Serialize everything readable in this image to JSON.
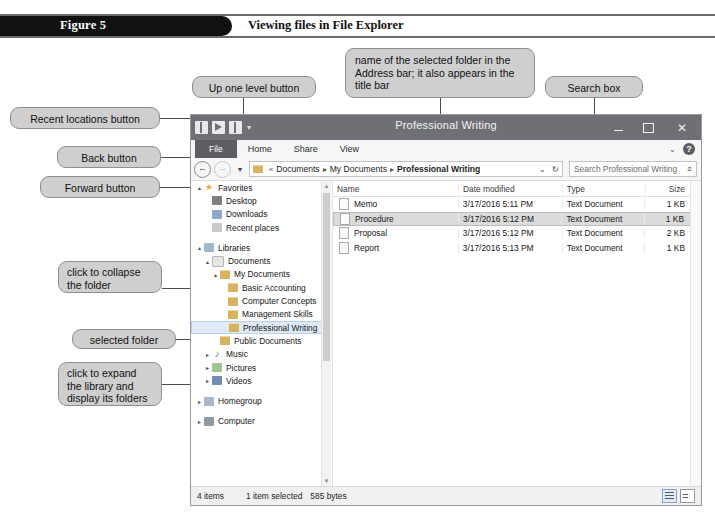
{
  "figure": {
    "label": "Figure 5",
    "title": "Viewing files in File Explorer"
  },
  "callouts": [
    {
      "id": "recent-locations",
      "text": "Recent locations button"
    },
    {
      "id": "back",
      "text": "Back button"
    },
    {
      "id": "forward",
      "text": "Forward button"
    },
    {
      "id": "up-one-level",
      "text": "Up one level button"
    },
    {
      "id": "address-bar-name",
      "text": "name of the selected folder in the Address bar; it also appears in the title bar"
    },
    {
      "id": "search-box",
      "text": "Search box"
    },
    {
      "id": "collapse-folder",
      "text": "click to collapse the folder"
    },
    {
      "id": "selected-folder",
      "text": "selected folder"
    },
    {
      "id": "expand-library",
      "text": "click to expand the library and display its folders"
    },
    {
      "id": "folder-contents",
      "text": "contents of the selected folder"
    }
  ],
  "window": {
    "title": "Professional Writing",
    "quick_access": [
      "properties-icon",
      "new-folder-icon",
      "properties2-icon",
      "customize-caret-icon"
    ],
    "controls": {
      "minimize": "minimize-icon",
      "maximize": "maximize-icon",
      "close": "✕"
    },
    "ribbon": {
      "tabs": [
        "File",
        "Home",
        "Share",
        "View"
      ],
      "collapse": "⌄",
      "help": "?"
    },
    "address": {
      "back": "←",
      "forward": "→",
      "recent": "▾",
      "up": "↑",
      "overflow": "«",
      "crumbs": [
        "Documents",
        "My Documents",
        "Professional Writing"
      ],
      "separator": "▸",
      "dropdown": "⌄",
      "refresh": "↻"
    },
    "search": {
      "placeholder": "Search Professional Writing",
      "icon": "⌕"
    },
    "nav_tree": [
      {
        "label": "Favorites",
        "indent": 0,
        "twisty": "▴",
        "icon": "ic-star",
        "selected": false
      },
      {
        "label": "Desktop",
        "indent": 1,
        "twisty": "",
        "icon": "ic-desktop",
        "selected": false
      },
      {
        "label": "Downloads",
        "indent": 1,
        "twisty": "",
        "icon": "ic-down",
        "selected": false
      },
      {
        "label": "Recent places",
        "indent": 1,
        "twisty": "",
        "icon": "ic-recent",
        "selected": false
      },
      {
        "label": "",
        "indent": 0,
        "twisty": "",
        "icon": "spacer",
        "selected": false
      },
      {
        "label": "Libraries",
        "indent": 0,
        "twisty": "▴",
        "icon": "ic-lib",
        "selected": false
      },
      {
        "label": "Documents",
        "indent": 1,
        "twisty": "▴",
        "icon": "ic-doc",
        "selected": false
      },
      {
        "label": "My Documents",
        "indent": 2,
        "twisty": "▴",
        "icon": "ic-folder",
        "selected": false
      },
      {
        "label": "Basic Accounting",
        "indent": 3,
        "twisty": "",
        "icon": "ic-folder",
        "selected": false
      },
      {
        "label": "Computer Concepts",
        "indent": 3,
        "twisty": "",
        "icon": "ic-folder",
        "selected": false
      },
      {
        "label": "Management Skills",
        "indent": 3,
        "twisty": "",
        "icon": "ic-folder",
        "selected": false
      },
      {
        "label": "Professional Writing",
        "indent": 3,
        "twisty": "",
        "icon": "ic-folder",
        "selected": true
      },
      {
        "label": "Public Documents",
        "indent": 2,
        "twisty": "",
        "icon": "ic-folder",
        "selected": false
      },
      {
        "label": "Music",
        "indent": 1,
        "twisty": "▸",
        "icon": "ic-music",
        "selected": false
      },
      {
        "label": "Pictures",
        "indent": 1,
        "twisty": "▸",
        "icon": "ic-pic",
        "selected": false
      },
      {
        "label": "Videos",
        "indent": 1,
        "twisty": "▸",
        "icon": "ic-vid",
        "selected": false
      },
      {
        "label": "",
        "indent": 0,
        "twisty": "",
        "icon": "spacer",
        "selected": false
      },
      {
        "label": "Homegroup",
        "indent": 0,
        "twisty": "▸",
        "icon": "ic-home",
        "selected": false
      },
      {
        "label": "",
        "indent": 0,
        "twisty": "",
        "icon": "spacer",
        "selected": false
      },
      {
        "label": "Computer",
        "indent": 0,
        "twisty": "▸",
        "icon": "ic-comp",
        "selected": false
      }
    ],
    "file_list": {
      "columns": [
        "Name",
        "Date modified",
        "Type",
        "Size"
      ],
      "sort_indicator": "▴",
      "rows": [
        {
          "name": "Memo",
          "date": "3/17/2016 5:11 PM",
          "type": "Text Document",
          "size": "1 KB",
          "selected": false
        },
        {
          "name": "Procedure",
          "date": "3/17/2016 5:12 PM",
          "type": "Text Document",
          "size": "1 KB",
          "selected": true
        },
        {
          "name": "Proposal",
          "date": "3/17/2016 5:12 PM",
          "type": "Text Document",
          "size": "2 KB",
          "selected": false
        },
        {
          "name": "Report",
          "date": "3/17/2016 5:13 PM",
          "type": "Text Document",
          "size": "1 KB",
          "selected": false
        }
      ]
    },
    "status": {
      "items": "4 items",
      "selected": "1 item selected",
      "size": "585 bytes",
      "view_details": "details-view-icon",
      "view_tiles": "tiles-view-icon"
    }
  },
  "colors": {
    "titlebar": "#6e7076",
    "callout_fill": "#cfcfcf",
    "selection": "#dbdbdb",
    "nav_selection": "#dfeaf6",
    "figure_bar": "#111111"
  }
}
